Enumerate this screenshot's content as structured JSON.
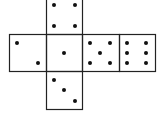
{
  "diagram": {
    "type": "die-net",
    "stroke_color": "#222222",
    "pip_color": "#111111",
    "background": "#ffffff",
    "faces": [
      {
        "name": "top",
        "value": 4,
        "x": 46,
        "y": -3,
        "w": 36,
        "h": 37,
        "pips": [
          [
            54,
            5
          ],
          [
            75,
            5
          ],
          [
            54,
            26
          ],
          [
            75,
            26
          ]
        ]
      },
      {
        "name": "left",
        "value": 2,
        "x": 9,
        "y": 34,
        "w": 37,
        "h": 37,
        "pips": [
          [
            17,
            43
          ],
          [
            38,
            63
          ]
        ]
      },
      {
        "name": "center",
        "value": 1,
        "x": 46,
        "y": 34,
        "w": 36,
        "h": 37,
        "pips": [
          [
            64,
            53
          ]
        ]
      },
      {
        "name": "right",
        "value": 5,
        "x": 82,
        "y": 34,
        "w": 37,
        "h": 37,
        "pips": [
          [
            90,
            43
          ],
          [
            110,
            43
          ],
          [
            100,
            53
          ],
          [
            90,
            63
          ],
          [
            110,
            63
          ]
        ]
      },
      {
        "name": "far-right",
        "value": 6,
        "x": 119,
        "y": 34,
        "w": 36,
        "h": 37,
        "pips": [
          [
            127,
            43
          ],
          [
            146,
            43
          ],
          [
            127,
            53
          ],
          [
            146,
            53
          ],
          [
            127,
            63
          ],
          [
            146,
            63
          ]
        ]
      },
      {
        "name": "bottom",
        "value": 3,
        "x": 46,
        "y": 71,
        "w": 36,
        "h": 38,
        "pips": [
          [
            54,
            80
          ],
          [
            64,
            90
          ],
          [
            75,
            101
          ]
        ]
      }
    ]
  }
}
